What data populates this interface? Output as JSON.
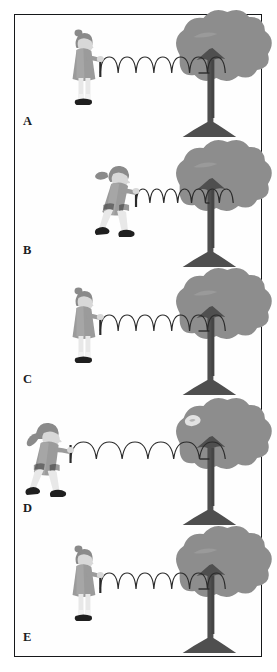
{
  "figure": {
    "background_color": "#ffffff",
    "frame_color": "#16181a",
    "panel_count": 5
  },
  "palette": {
    "canopy_fill": "#8d8d8d",
    "canopy_shadow": "#7a7a7a",
    "trunk_fill": "#4f4f4f",
    "trunk_shade": "#454545",
    "spring_stroke": "#2b2b2b",
    "dress_fill": "#9b9b9b",
    "dress_shade": "#868686",
    "skin_fill": "#d8d8d8",
    "hair_fill": "#8a8a8a",
    "shoe_fill": "#1f1f1f",
    "sock_fill": "#e8e8e8",
    "bar_stroke": "#2b2b2b",
    "label_color": "#1b1d1f"
  },
  "panels": [
    {
      "id": "panel-a",
      "label": "A",
      "pose": "standing-upright",
      "pose_description": "Girl stands upright, arms extended forward holding the spring handle",
      "spring_state": "natural",
      "spring_loops": 7,
      "spring_length_px": 100,
      "girl_x": 78,
      "tree_decoration": "none"
    },
    {
      "id": "panel-b",
      "label": "B",
      "pose": "leaning-forward",
      "pose_description": "Girl leans forward in a pushing stance, legs apart, compressing the spring",
      "spring_state": "compressed",
      "spring_loops": 7,
      "spring_length_px": 72,
      "girl_x": 104,
      "tree_decoration": "none"
    },
    {
      "id": "panel-c",
      "label": "C",
      "pose": "standing-upright",
      "pose_description": "Girl stands upright, arms extended forward holding the spring handle",
      "spring_state": "natural",
      "spring_loops": 7,
      "spring_length_px": 100,
      "girl_x": 78,
      "tree_decoration": "none"
    },
    {
      "id": "panel-d",
      "label": "D",
      "pose": "leaning-back",
      "pose_description": "Girl leans back, legs apart in a pulling stance, stretching the spring",
      "spring_state": "stretched",
      "spring_loops": 6,
      "spring_length_px": 140,
      "girl_x": 30,
      "tree_decoration": "light-patch"
    },
    {
      "id": "panel-e",
      "label": "E",
      "pose": "standing-upright",
      "pose_description": "Girl stands upright, arms extended forward holding the spring handle",
      "spring_state": "natural",
      "spring_loops": 7,
      "spring_length_px": 100,
      "girl_x": 78,
      "tree_decoration": "none"
    }
  ]
}
